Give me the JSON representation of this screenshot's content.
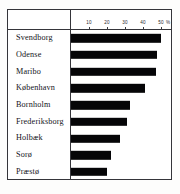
{
  "chart_data": {
    "type": "bar",
    "orientation": "horizontal",
    "title": "",
    "subtitle": "",
    "xlabel": "",
    "ylabel": "",
    "unit": "%",
    "xlim": [
      0,
      55
    ],
    "grid": false,
    "legend": null,
    "axis_ticks": [
      {
        "value": 10,
        "label": "10"
      },
      {
        "value": 20,
        "label": "20"
      },
      {
        "value": 30,
        "label": "30"
      },
      {
        "value": 40,
        "label": "40"
      },
      {
        "value": 50,
        "label": "50"
      }
    ],
    "axis_unit_label": "%",
    "categories": [
      "Svendborg",
      "Odense",
      "Maribo",
      "København",
      "Bornholm",
      "Frederiksborg",
      "Holbæk",
      "Sorø",
      "Præstø"
    ],
    "values": [
      50,
      48,
      47,
      41,
      33,
      31,
      27,
      22,
      20
    ],
    "bar_color": "#050507"
  },
  "style": {
    "frame_color": "#35353a",
    "background": "#ffffff",
    "text_color": "#14141a"
  }
}
